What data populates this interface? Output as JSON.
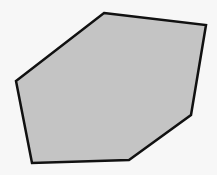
{
  "canvas": {
    "width": 217,
    "height": 175,
    "background": "#f7f7f7"
  },
  "shape": {
    "type": "hexagon",
    "points": [
      [
        104,
        13
      ],
      [
        206,
        25
      ],
      [
        191,
        115
      ],
      [
        129,
        160
      ],
      [
        32,
        163
      ],
      [
        16,
        81
      ]
    ],
    "fill": "#c4c4c4",
    "stroke": "#111111",
    "stroke_width": 2.5
  }
}
